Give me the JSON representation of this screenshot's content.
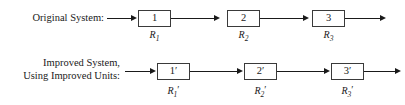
{
  "diagram": {
    "line_color": "#1a1a1a",
    "box_border_color": "#3a3a3a",
    "background": "#ffffff",
    "rows": [
      {
        "id": "original",
        "label_lines": [
          "Original System:"
        ],
        "boxes": [
          {
            "text": "1",
            "sub_prefix": "R",
            "sub_index": "1",
            "sub_prime": ""
          },
          {
            "text": "2",
            "sub_prefix": "R",
            "sub_index": "2",
            "sub_prime": ""
          },
          {
            "text": "3",
            "sub_prefix": "R",
            "sub_index": "3",
            "sub_prime": ""
          }
        ]
      },
      {
        "id": "improved",
        "label_lines": [
          "Improved System,",
          "Using Improved Units:"
        ],
        "boxes": [
          {
            "text": "1",
            "box_prime": "′",
            "sub_prefix": "R",
            "sub_index": "1",
            "sub_prime": "′"
          },
          {
            "text": "2",
            "box_prime": "′",
            "sub_prefix": "R",
            "sub_index": "2",
            "sub_prime": "′"
          },
          {
            "text": "3",
            "box_prime": "′",
            "sub_prefix": "R",
            "sub_index": "3",
            "sub_prime": "′"
          }
        ]
      }
    ]
  }
}
